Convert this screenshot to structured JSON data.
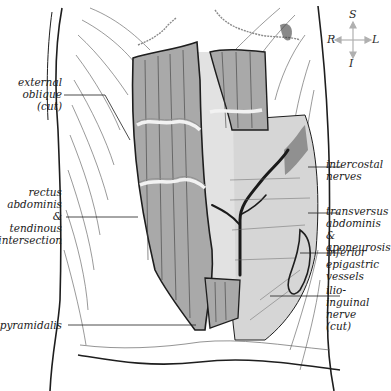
{
  "diagram": {
    "colors": {
      "muscle_fill": "#a9a9a9",
      "light_fill": "#d9d9d9",
      "line": "#1e1e1e",
      "fascia_edge": "#8a8a8a",
      "background": "#ffffff",
      "compass": "#b0b0b0"
    }
  },
  "compass": {
    "superior": "S",
    "inferior": "I",
    "right": "R",
    "left": "L"
  },
  "labels": {
    "external_oblique": "external\noblique\n(cut)",
    "rectus_abdominis": "rectus\nabdominis &\ntendinous\nintersection",
    "pyramidalis": "pyramidalis",
    "intercostal_nerves": "intercostal\nnerves",
    "transversus_abdominis": "transversus\nabdominis &\naponeurosis",
    "inferior_epigastric": "inferior\nepigastric\nvessels",
    "ilioinguinal_nerve": "ilio-\ninguinal\nnerve\n(cut)"
  }
}
